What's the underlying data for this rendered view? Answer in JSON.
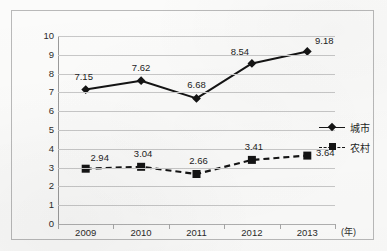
{
  "chart_data": {
    "type": "line",
    "title": "",
    "xlabel": "(年)",
    "ylabel": "",
    "categories": [
      "2009",
      "2010",
      "2011",
      "2012",
      "2013"
    ],
    "ylim": [
      0,
      10
    ],
    "yticks": [
      "0",
      "1",
      "2",
      "3",
      "4",
      "5",
      "6",
      "7",
      "8",
      "9",
      "10"
    ],
    "grid": true,
    "legend_position": "right-middle",
    "series": [
      {
        "name": "城市",
        "marker": "diamond",
        "linestyle": "solid",
        "color": "#141414",
        "values": [
          7.15,
          7.62,
          6.68,
          8.54,
          9.18
        ],
        "labels": [
          "7.15",
          "7.62",
          "6.68",
          "8.54",
          "9.18"
        ]
      },
      {
        "name": "农村",
        "marker": "square",
        "linestyle": "dashed",
        "color": "#141414",
        "values": [
          2.94,
          3.04,
          2.66,
          3.41,
          3.64
        ],
        "labels": [
          "2.94",
          "3.04",
          "2.66",
          "3.41",
          "3.64"
        ]
      }
    ]
  },
  "legend": {
    "items": [
      {
        "label": "城市"
      },
      {
        "label": "农村"
      }
    ]
  }
}
